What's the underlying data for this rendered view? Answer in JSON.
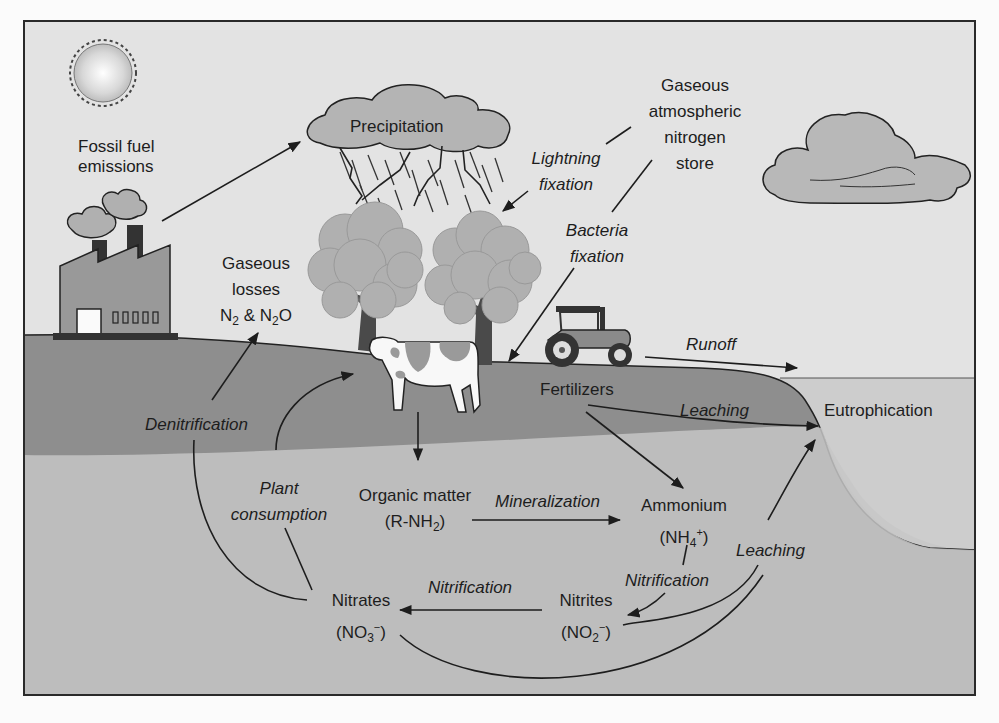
{
  "diagram": {
    "colors": {
      "sky": "#e2e2e2",
      "ground": "#8f8f8f",
      "subsoil": "#c9c9c9",
      "water": "#cfcfcf",
      "frame": "#2a2a2a",
      "text": "#1d1d1d",
      "foliage": "#b3b3b3",
      "trunk": "#4a4a4a"
    },
    "illustrations": [
      "sun",
      "factory-with-smokestacks",
      "rain-cloud-with-lightning",
      "cloud",
      "tree",
      "tree",
      "cow",
      "tractor"
    ],
    "labels": {
      "fossil_fuel": [
        "Fossil fuel",
        "emissions"
      ],
      "precipitation": "Precipitation",
      "gaseous_store": [
        "Gaseous",
        "atmospheric",
        "nitrogen",
        "store"
      ],
      "lightning": [
        "Lightning",
        "fixation"
      ],
      "bacteria": [
        "Bacteria",
        "fixation"
      ],
      "gaseous_losses": [
        "Gaseous",
        "losses"
      ],
      "gaseous_losses_formula": {
        "n": "N",
        "sub1": "2",
        "amp": " & N",
        "sub2": "2",
        "o": "O"
      },
      "runoff": "Runoff",
      "fertilizers": "Fertilizers",
      "leaching_top": "Leaching",
      "eutrophication": "Eutrophication",
      "denitrification": "Denitrification",
      "plant_consumption": [
        "Plant",
        "consumption"
      ],
      "organic_matter": "Organic matter",
      "organic_formula": {
        "pre": "(R-NH",
        "sub": "2",
        "post": ")"
      },
      "mineralization": "Mineralization",
      "ammonium": "Ammonium",
      "ammonium_formula": {
        "pre": "(NH",
        "sub": "4",
        "sup": "+",
        "post": ")"
      },
      "nitrification_right": "Nitrification",
      "leaching_right": "Leaching",
      "nitrites": "Nitrites",
      "nitrites_formula": {
        "pre": "(NO",
        "sub": "2",
        "sup": "−",
        "post": ")"
      },
      "nitrification_bottom": "Nitrification",
      "nitrates": "Nitrates",
      "nitrates_formula": {
        "pre": "(NO",
        "sub": "3",
        "sup": "−",
        "post": ")"
      }
    }
  }
}
